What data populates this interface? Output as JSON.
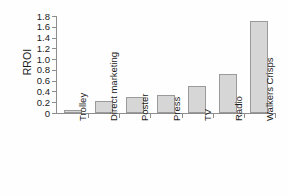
{
  "chart_data": {
    "type": "bar",
    "title": "",
    "subtitle": "",
    "xlabel": "",
    "ylabel": "RROI",
    "categories": [
      "Trolley",
      "Direct marketing",
      "Poster",
      "Press",
      "TV",
      "Radio",
      "Walkers Crisps"
    ],
    "values": [
      0.05,
      0.22,
      0.29,
      0.34,
      0.51,
      0.72,
      1.7
    ],
    "ylim": [
      0,
      1.8
    ],
    "ytick_labels": [
      "0",
      "0.2",
      "0.4",
      "0.6",
      "0.8",
      "1.0",
      "1.2",
      "1.4",
      "1.6",
      "1.8"
    ],
    "ytick_values": [
      0,
      0.2,
      0.4,
      0.6,
      0.8,
      1.0,
      1.2,
      1.4,
      1.6,
      1.8
    ],
    "grid": false,
    "legend": false,
    "legend_position": "none",
    "bar_fill_color": "#d6d6d6",
    "bar_edge_color": "#9a9a9a",
    "axis_color": "#8e8e8e",
    "background_color": "#ffffff",
    "text_color": "#1a1a1a",
    "x_tick_label_rotation": -90
  }
}
